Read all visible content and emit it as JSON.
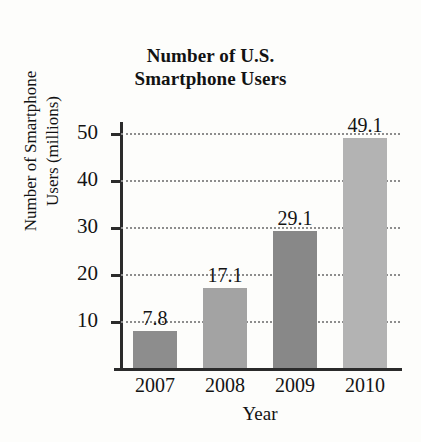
{
  "chart_data": {
    "type": "bar",
    "title": "Number of U.S. Smartphone Users",
    "title_lines": [
      "Number of U.S.",
      "Smartphone Users"
    ],
    "xlabel": "Year",
    "ylabel": "Number of Smartphone Users (millions)",
    "ylabel_lines": [
      "Number of Smartphone",
      "Users (millions)"
    ],
    "categories": [
      "2007",
      "2008",
      "2009",
      "2010"
    ],
    "values": [
      7.8,
      17.1,
      29.1,
      49.1
    ],
    "value_labels": [
      "7.8",
      "17.1",
      "29.1",
      "49.1"
    ],
    "bar_colors": [
      "#8d8d8d",
      "#a3a3a3",
      "#888888",
      "#b3b3b3"
    ],
    "ylim": [
      0,
      52
    ],
    "yticks": [
      10,
      20,
      30,
      40,
      50
    ],
    "ytick_labels": [
      "10",
      "20",
      "30",
      "40",
      "50"
    ],
    "grid": "horizontal-dotted",
    "legend": "none",
    "axis_color": "#2b2b2b",
    "grid_color": "#8d8d8d",
    "background": "#fdfdfb"
  }
}
